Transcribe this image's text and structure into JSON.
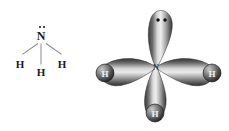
{
  "figure": {
    "background_color": "#ffffff",
    "width": 229,
    "height": 131
  },
  "lewis_structure": {
    "name": "ammonia-lewis-structure",
    "central_atom": {
      "symbol": "N",
      "x": 41,
      "y": 36,
      "color": "#1a1a1a"
    },
    "lone_pair": {
      "label": "lone-pair",
      "electron_count": 2,
      "dots": [
        {
          "x": 39.7,
          "y": 26.7
        },
        {
          "x": 44.0,
          "y": 26.7
        }
      ],
      "color": "#111111"
    },
    "hydrogens": [
      {
        "symbol": "H",
        "position": "left",
        "x": 20,
        "y": 64
      },
      {
        "symbol": "H",
        "position": "bottom",
        "x": 41,
        "y": 72
      },
      {
        "symbol": "H",
        "position": "right",
        "x": 62,
        "y": 64
      }
    ],
    "bonds": [
      {
        "from": "N",
        "to": "H-left",
        "style": "line",
        "color": "#8b8b8b"
      },
      {
        "from": "N",
        "to": "H-bottom",
        "style": "line",
        "color": "#8b8b8b"
      },
      {
        "from": "N",
        "to": "H-right",
        "style": "line",
        "color": "#8b8b8b"
      }
    ]
  },
  "orbital_model": {
    "name": "ammonia-sp3-orbital-model",
    "hybridization": "sp3",
    "center_label": "N",
    "center": {
      "x": 62,
      "y": 67
    },
    "lobes": [
      {
        "id": "lobe-lone-pair",
        "direction": "up",
        "angle_deg": -90,
        "occupancy": "lone pair",
        "length": 58
      },
      {
        "id": "lobe-bond-left",
        "direction": "left",
        "angle_deg": 180,
        "occupancy": "bonding pair",
        "length": 52
      },
      {
        "id": "lobe-bond-right",
        "direction": "right",
        "angle_deg": 0,
        "occupancy": "bonding pair",
        "length": 52
      },
      {
        "id": "lobe-bond-down",
        "direction": "down",
        "angle_deg": 90,
        "occupancy": "bonding pair",
        "length": 50
      }
    ],
    "lone_pair_dots": [
      {
        "x": 64,
        "y": 20
      },
      {
        "x": 71,
        "y": 20
      }
    ],
    "hydrogen_spheres": [
      {
        "label": "H",
        "position": "left",
        "x": 11,
        "y": 73,
        "r": 9
      },
      {
        "label": "H",
        "position": "right",
        "x": 118,
        "y": 73,
        "r": 9
      },
      {
        "label": "H",
        "position": "bottom",
        "x": 61,
        "y": 113,
        "r": 9
      }
    ],
    "colors": {
      "lobe_dark": "#2e2e2e",
      "lobe_mid": "#8a8a8a",
      "lobe_light": "#e8e8e8",
      "sphere_dark": "#1c1c1c",
      "sphere_light": "#b9b9b9",
      "label_light": "#f2f2f2",
      "label_dark": "#3c3c3c"
    }
  }
}
